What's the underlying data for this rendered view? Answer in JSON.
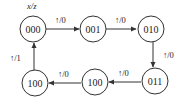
{
  "diagram": {
    "type": "state-transition",
    "legend": "x/z",
    "states": [
      {
        "id": "s0",
        "label": "000"
      },
      {
        "id": "s1",
        "label": "001"
      },
      {
        "id": "s2",
        "label": "010"
      },
      {
        "id": "s3",
        "label": "011"
      },
      {
        "id": "s4",
        "label": "100"
      },
      {
        "id": "s5",
        "label": "100"
      }
    ],
    "transitions": [
      {
        "from": "000",
        "to": "001",
        "label": "↑/0"
      },
      {
        "from": "001",
        "to": "010",
        "label": "↑/0"
      },
      {
        "from": "010",
        "to": "011",
        "label": "↑/0"
      },
      {
        "from": "011",
        "to": "100",
        "label": "↑/0"
      },
      {
        "from": "100",
        "to": "100",
        "label": "↑/0"
      },
      {
        "from": "100",
        "to": "000",
        "label": "↑/1"
      }
    ],
    "colors": {
      "stroke": "#333333",
      "text": "#222222",
      "background": "#ffffff"
    }
  }
}
